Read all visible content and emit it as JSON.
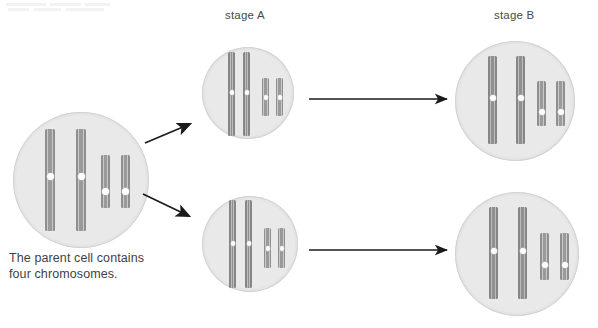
{
  "figure": {
    "title_caption": "The parent cell contains\nfour chromosomes.",
    "labels": {
      "stage_a": "stage A",
      "stage_b": "stage B"
    },
    "colors": {
      "cell_fill": "#e4e4e4",
      "cell_inner": "#e9e9e9",
      "cell_border": "#d2d2d2",
      "chromosome_gray": "#9a9a9a",
      "chromosome_edge": "#8f8f8f",
      "chromosome_highlight": "#c9c9c9",
      "centromere": "#ffffff",
      "arrow": "#1a1a1a",
      "text": "#3f3f3f",
      "background": "#ffffff"
    }
  },
  "cells": [
    {
      "id": "parent-cell",
      "name": "parent-cell",
      "stage": "parent",
      "chromosome_count": 4,
      "chromosomes": [
        {
          "type": "long",
          "centromere": true
        },
        {
          "type": "long",
          "centromere": true
        },
        {
          "type": "short",
          "centromere": true
        },
        {
          "type": "short",
          "centromere": true
        }
      ]
    },
    {
      "id": "stage-a-top-cell",
      "name": "stage-a-top-cell",
      "stage": "stage A",
      "chromosome_count": 4,
      "chromosomes": [
        {
          "type": "long",
          "centromere": true,
          "extends_beyond_membrane": true
        },
        {
          "type": "long",
          "centromere": true,
          "extends_beyond_membrane": true
        },
        {
          "type": "short",
          "centromere": true,
          "extends_beyond_membrane": false
        },
        {
          "type": "short",
          "centromere": true,
          "extends_beyond_membrane": false
        }
      ]
    },
    {
      "id": "stage-a-bottom-cell",
      "name": "stage-a-bottom-cell",
      "stage": "stage A",
      "chromosome_count": 4,
      "chromosomes": [
        {
          "type": "long",
          "centromere": true,
          "extends_beyond_membrane": true
        },
        {
          "type": "long",
          "centromere": true,
          "extends_beyond_membrane": true
        },
        {
          "type": "short",
          "centromere": true,
          "extends_beyond_membrane": false
        },
        {
          "type": "short",
          "centromere": true,
          "extends_beyond_membrane": false
        }
      ]
    },
    {
      "id": "stage-b-top-cell",
      "name": "stage-b-top-cell",
      "stage": "stage B",
      "chromosome_count": 4,
      "chromosomes": [
        {
          "type": "long",
          "centromere": true,
          "extends_beyond_membrane": false
        },
        {
          "type": "long",
          "centromere": true,
          "extends_beyond_membrane": false
        },
        {
          "type": "short",
          "centromere": true,
          "extends_beyond_membrane": false
        },
        {
          "type": "short",
          "centromere": true,
          "extends_beyond_membrane": false
        }
      ]
    },
    {
      "id": "stage-b-bottom-cell",
      "name": "stage-b-bottom-cell",
      "stage": "stage B",
      "chromosome_count": 4,
      "chromosomes": [
        {
          "type": "long",
          "centromere": true,
          "extends_beyond_membrane": false
        },
        {
          "type": "long",
          "centromere": true,
          "extends_beyond_membrane": false
        },
        {
          "type": "short",
          "centromere": true,
          "extends_beyond_membrane": false
        },
        {
          "type": "short",
          "centromere": true,
          "extends_beyond_membrane": false
        }
      ]
    }
  ],
  "arrows": [
    {
      "id": "arrow-parent-to-stage-a-top",
      "from": "parent-cell",
      "to": "stage-a-top-cell",
      "direction": "up-right"
    },
    {
      "id": "arrow-parent-to-stage-a-bottom",
      "from": "parent-cell",
      "to": "stage-a-bottom-cell",
      "direction": "down-right"
    },
    {
      "id": "arrow-stage-a-top-to-stage-b-top",
      "from": "stage-a-top-cell",
      "to": "stage-b-top-cell",
      "direction": "right"
    },
    {
      "id": "arrow-stage-a-bottom-to-stage-b-bottom",
      "from": "stage-a-bottom-cell",
      "to": "stage-b-bottom-cell",
      "direction": "right"
    }
  ]
}
